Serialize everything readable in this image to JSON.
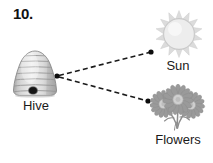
{
  "page": {
    "question_number": "10.",
    "background_color": "#ffffff",
    "width": 213,
    "height": 163
  },
  "diagram": {
    "type": "relationship-diagram",
    "nodes": [
      {
        "id": "hive",
        "label": "Hive",
        "icon": "beehive-icon",
        "center": [
          35,
          74
        ],
        "label_position": [
          35,
          106
        ],
        "colors": {
          "body_light": "#e9e9e9",
          "body_mid": "#c9c9c9",
          "body_dark": "#9a9a9a",
          "outline": "#7d7d7d",
          "entrance": "#1a1a1a"
        },
        "band_count": 7
      },
      {
        "id": "sun",
        "label": "Sun",
        "icon": "sun-icon",
        "center": [
          179,
          34
        ],
        "label_position": [
          178,
          66
        ],
        "colors": {
          "disc": "#ececec",
          "rays": "#d8d8d8",
          "outline": "#c4c4c4"
        },
        "ray_count": 14
      },
      {
        "id": "flowers",
        "label": "Flowers",
        "icon": "flowers-icon",
        "center": [
          178,
          105
        ],
        "label_position": [
          178,
          140
        ],
        "colors": {
          "petals": "#9d9d9d",
          "petals_light": "#bdbdbd",
          "center": "#d2d2d2",
          "stems": "#8c8c8c"
        },
        "flower_count": 3
      }
    ],
    "edges": [
      {
        "id": "hive-to-sun",
        "from": "hive",
        "to": "sun",
        "style": "dashed",
        "start_point": [
          57,
          76
        ],
        "end_point": [
          151,
          52
        ],
        "start_marker": "dot",
        "end_marker": "dot",
        "color": "#1a1a1a"
      },
      {
        "id": "hive-to-flowers",
        "from": "hive",
        "to": "flowers",
        "style": "dashed",
        "start_point": [
          57,
          76
        ],
        "end_point": [
          148,
          101
        ],
        "start_marker": "dot",
        "end_marker": "dot",
        "color": "#1a1a1a"
      }
    ]
  }
}
